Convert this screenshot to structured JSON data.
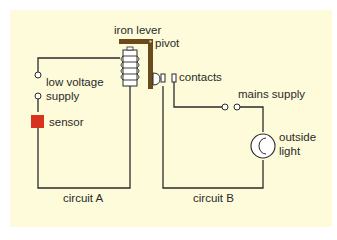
{
  "diagram": {
    "background_color": "#fdfbd9",
    "wire_color": "#2b2b2b",
    "lever_color": "#6b4a1c",
    "sensor_color": "#d8321e",
    "labels": {
      "iron_lever": "iron lever",
      "pivot": "pivot",
      "contacts": "contacts",
      "low_voltage_supply_line1": "low voltage",
      "low_voltage_supply_line2": "supply",
      "sensor": "sensor",
      "mains_supply": "mains supply",
      "outside_light_line1": "outside",
      "outside_light_line2": "light",
      "circuit_a": "circuit A",
      "circuit_b": "circuit B"
    },
    "components": [
      {
        "name": "low voltage supply",
        "circuit": "A"
      },
      {
        "name": "sensor",
        "circuit": "A"
      },
      {
        "name": "electromagnet coil",
        "circuit": "A"
      },
      {
        "name": "iron lever",
        "pivot": true
      },
      {
        "name": "contacts",
        "circuit": "B"
      },
      {
        "name": "mains supply",
        "circuit": "B"
      },
      {
        "name": "outside light",
        "circuit": "B"
      }
    ]
  }
}
